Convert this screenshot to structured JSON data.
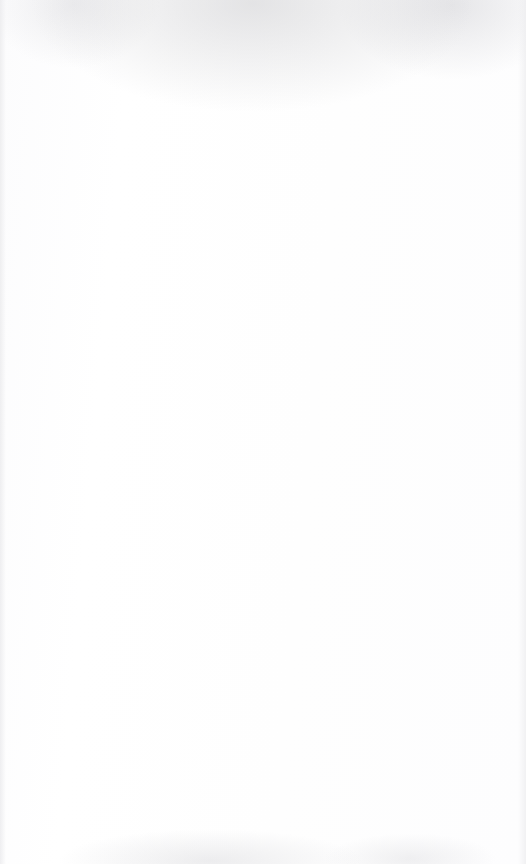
{
  "document": {
    "kind": "lined-notebook-page",
    "page_width": 526,
    "page_height": 864,
    "background_color": "#fefefe",
    "rule_color": "#4a4a4c",
    "rule_thickness_px": 1,
    "rule_left_x": 4,
    "rule_right_x": 519,
    "first_rule_y": 63,
    "last_rule_y": 822,
    "rule_spacing_px": 38.8,
    "rule_count": 21,
    "header_text": "",
    "footer_text": "",
    "rules": [
      {
        "index": 1,
        "y": 63,
        "left": 4,
        "right": 519
      },
      {
        "index": 2,
        "y": 102,
        "left": 4,
        "right": 519
      },
      {
        "index": 3,
        "y": 140,
        "left": 4,
        "right": 519
      },
      {
        "index": 4,
        "y": 179,
        "left": 4,
        "right": 519
      },
      {
        "index": 5,
        "y": 218,
        "left": 4,
        "right": 519
      },
      {
        "index": 6,
        "y": 257,
        "left": 4,
        "right": 519
      },
      {
        "index": 7,
        "y": 295,
        "left": 4,
        "right": 519
      },
      {
        "index": 8,
        "y": 334,
        "left": 4,
        "right": 519
      },
      {
        "index": 9,
        "y": 373,
        "left": 4,
        "right": 519
      },
      {
        "index": 10,
        "y": 412,
        "left": 4,
        "right": 519
      },
      {
        "index": 11,
        "y": 450,
        "left": 4,
        "right": 519
      },
      {
        "index": 12,
        "y": 489,
        "left": 4,
        "right": 519
      },
      {
        "index": 13,
        "y": 528,
        "left": 4,
        "right": 519
      },
      {
        "index": 14,
        "y": 567,
        "left": 4,
        "right": 519
      },
      {
        "index": 15,
        "y": 605,
        "left": 4,
        "right": 519
      },
      {
        "index": 16,
        "y": 644,
        "left": 4,
        "right": 519
      },
      {
        "index": 17,
        "y": 683,
        "left": 4,
        "right": 519
      },
      {
        "index": 18,
        "y": 722,
        "left": 4,
        "right": 519
      },
      {
        "index": 19,
        "y": 760,
        "left": 4,
        "right": 519
      },
      {
        "index": 20,
        "y": 799,
        "left": 4,
        "right": 519
      },
      {
        "index": 21,
        "y": 822,
        "left": 4,
        "right": 519
      }
    ],
    "writing_rows": [
      {
        "index": 1,
        "top": 64,
        "height": 37,
        "text": ""
      },
      {
        "index": 2,
        "top": 103,
        "height": 36,
        "text": ""
      },
      {
        "index": 3,
        "top": 141,
        "height": 37,
        "text": ""
      },
      {
        "index": 4,
        "top": 180,
        "height": 37,
        "text": ""
      },
      {
        "index": 5,
        "top": 219,
        "height": 37,
        "text": ""
      },
      {
        "index": 6,
        "top": 258,
        "height": 36,
        "text": ""
      },
      {
        "index": 7,
        "top": 296,
        "height": 37,
        "text": ""
      },
      {
        "index": 8,
        "top": 335,
        "height": 37,
        "text": ""
      },
      {
        "index": 9,
        "top": 374,
        "height": 37,
        "text": ""
      },
      {
        "index": 10,
        "top": 413,
        "height": 36,
        "text": ""
      },
      {
        "index": 11,
        "top": 451,
        "height": 37,
        "text": ""
      },
      {
        "index": 12,
        "top": 490,
        "height": 37,
        "text": ""
      },
      {
        "index": 13,
        "top": 529,
        "height": 37,
        "text": ""
      },
      {
        "index": 14,
        "top": 568,
        "height": 36,
        "text": ""
      },
      {
        "index": 15,
        "top": 606,
        "height": 37,
        "text": ""
      },
      {
        "index": 16,
        "top": 645,
        "height": 37,
        "text": ""
      },
      {
        "index": 17,
        "top": 684,
        "height": 37,
        "text": ""
      },
      {
        "index": 18,
        "top": 723,
        "height": 36,
        "text": ""
      },
      {
        "index": 19,
        "top": 761,
        "height": 37,
        "text": ""
      },
      {
        "index": 20,
        "top": 800,
        "height": 21,
        "text": ""
      },
      {
        "index": 21,
        "top": 823,
        "height": 40,
        "text": ""
      }
    ]
  }
}
